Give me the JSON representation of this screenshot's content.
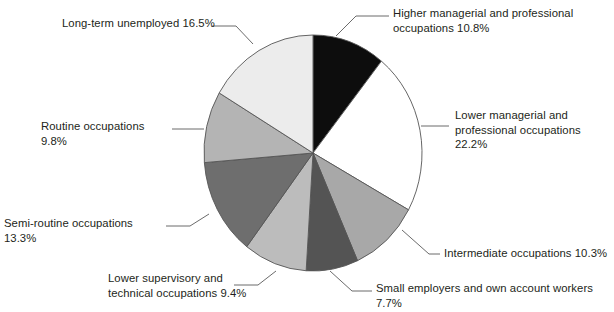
{
  "chart_data": {
    "type": "pie",
    "title": "",
    "subtitle": "",
    "xlabel": "",
    "ylabel": "",
    "legend_position": "callout-labels",
    "grid": false,
    "units": "percent",
    "total": 100.0,
    "start_angle_deg": 0,
    "direction": "clockwise",
    "categories": [
      "Higher managerial and professional occupations",
      "Lower managerial and professional occupations",
      "Intermediate occupations",
      "Small employers and own account workers",
      "Lower supervisory and technical occupations",
      "Semi-routine occupations",
      "Routine occupations",
      "Long-term unemployed"
    ],
    "values": [
      10.8,
      22.2,
      10.3,
      7.7,
      9.4,
      13.3,
      9.8,
      16.5
    ],
    "colors": [
      "#0d0d0d",
      "#ffffff",
      "#a8a8a8",
      "#545454",
      "#bcbcbc",
      "#6e6e6e",
      "#b4b4b4",
      "#ececec"
    ],
    "slices": [
      {
        "name": "higher-managerial",
        "label": "Higher managerial and professional\noccupations 10.8%",
        "value": 10.8,
        "value_text": "10.8%",
        "color": "#0d0d0d"
      },
      {
        "name": "lower-managerial",
        "label": "Lower managerial and\nprofessional occupations 22.2%",
        "value": 22.2,
        "value_text": "22.2%",
        "color": "#ffffff"
      },
      {
        "name": "intermediate",
        "label": "Intermediate occupations 10.3%",
        "value": 10.3,
        "value_text": "10.3%",
        "color": "#a8a8a8"
      },
      {
        "name": "small-employers",
        "label": "Small employers and own account workers 7.7%",
        "value": 7.7,
        "value_text": "7.7%",
        "color": "#545454"
      },
      {
        "name": "lower-supervisory",
        "label": "Lower supervisory and\ntechnical occupations 9.4%",
        "value": 9.4,
        "value_text": "9.4%",
        "color": "#bcbcbc"
      },
      {
        "name": "semi-routine",
        "label": "Semi-routine occupations 13.3%",
        "value": 13.3,
        "value_text": "13.3%",
        "color": "#6e6e6e"
      },
      {
        "name": "routine",
        "label": "Routine occupations 9.8%",
        "value": 9.8,
        "value_text": "9.8%",
        "color": "#b4b4b4"
      },
      {
        "name": "long-term-unemployed",
        "label": "Long-term unemployed 16.5%",
        "value": 16.5,
        "value_text": "16.5%",
        "color": "#ececec"
      }
    ]
  },
  "geometry": {
    "cx": 313,
    "cy": 153,
    "rx": 109,
    "ry": 118,
    "stroke": "#555555",
    "stroke_width": 0.9
  },
  "labels": [
    {
      "key": "higher-managerial",
      "x": 393,
      "y": 6,
      "w": 218,
      "align": "right"
    },
    {
      "key": "lower-managerial",
      "x": 455,
      "y": 108,
      "w": 158,
      "align": "right"
    },
    {
      "key": "intermediate",
      "x": 444,
      "y": 246,
      "w": 168,
      "align": "right"
    },
    {
      "key": "small-employers",
      "x": 376,
      "y": 281,
      "w": 237,
      "align": "right"
    },
    {
      "key": "lower-supervisory",
      "x": 108,
      "y": 271,
      "w": 148,
      "align": "right"
    },
    {
      "key": "semi-routine",
      "x": 4,
      "y": 216,
      "w": 160,
      "align": "right"
    },
    {
      "key": "routine",
      "x": 41,
      "y": 119,
      "w": 128,
      "align": "right"
    },
    {
      "key": "long-term-unemployed",
      "x": 62,
      "y": 16,
      "w": 174,
      "align": "right"
    }
  ],
  "leaders": [
    {
      "key": "higher-managerial",
      "points": "336,36 356,16 389,16"
    },
    {
      "key": "lower-managerial",
      "points": "421,126 449,126"
    },
    {
      "key": "intermediate",
      "points": "402,230 429,254 440,254"
    },
    {
      "key": "small-employers",
      "points": "330,271 352,291 372,291"
    },
    {
      "key": "lower-supervisory",
      "points": "276,271 258,285 234,285"
    },
    {
      "key": "semi-routine",
      "points": "209,214 190,226 166,226"
    },
    {
      "key": "routine",
      "points": "204,129 192,129 172,129"
    },
    {
      "key": "long-term-unemployed",
      "points": "253,44 236,26 212,26"
    }
  ]
}
